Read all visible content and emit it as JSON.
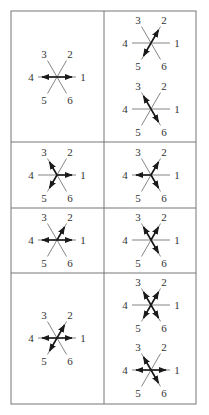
{
  "table": {
    "x0": 11,
    "x1": 196,
    "xmid": 104,
    "row_lines": [
      11,
      142,
      208,
      273,
      404
    ],
    "border_color": "#777777"
  },
  "spoke_labels": [
    "1",
    "2",
    "3",
    "4",
    "5",
    "6"
  ],
  "stars": [
    {
      "row": 0,
      "col": 0,
      "cx": 57,
      "cy": 77,
      "arrows": [
        4,
        1
      ]
    },
    {
      "row": 0,
      "col": 1,
      "cx": 151,
      "cy": 43,
      "arrows": [
        2,
        5
      ]
    },
    {
      "row": 0,
      "col": 1,
      "cx": 151,
      "cy": 109,
      "arrows": [
        3,
        6
      ]
    },
    {
      "row": 1,
      "col": 0,
      "cx": 57,
      "cy": 175,
      "arrows": [
        3,
        1,
        5
      ]
    },
    {
      "row": 1,
      "col": 1,
      "cx": 151,
      "cy": 175,
      "arrows": [
        2,
        4,
        6
      ]
    },
    {
      "row": 2,
      "col": 0,
      "cx": 57,
      "cy": 240,
      "arrows": [
        4,
        1,
        2
      ]
    },
    {
      "row": 2,
      "col": 1,
      "cx": 151,
      "cy": 240,
      "arrows": [
        3,
        2,
        6
      ]
    },
    {
      "row": 3,
      "col": 0,
      "cx": 57,
      "cy": 338,
      "arrows": [
        4,
        1,
        2,
        5
      ]
    },
    {
      "row": 3,
      "col": 1,
      "cx": 151,
      "cy": 305,
      "arrows": [
        3,
        2,
        5,
        6
      ]
    },
    {
      "row": 3,
      "col": 1,
      "cx": 151,
      "cy": 370,
      "arrows": [
        3,
        4,
        1,
        6
      ]
    }
  ]
}
